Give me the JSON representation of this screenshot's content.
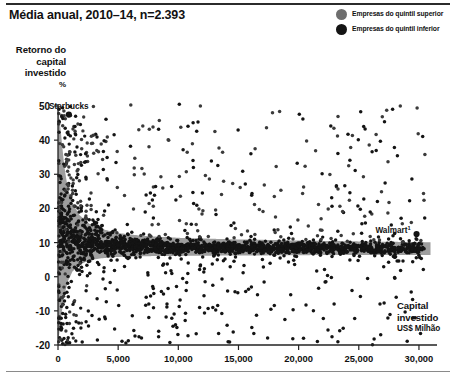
{
  "header": {
    "title": "Média anual, 2010–14, n=2.393"
  },
  "legend": {
    "position": "top-right",
    "items": [
      {
        "label": "Empresas do quintil superior",
        "color": "#6e6e6e",
        "key": "top-quintile"
      },
      {
        "label": "Empresas do quintil inferior",
        "color": "#141414",
        "key": "bottom-quintile"
      }
    ]
  },
  "axes": {
    "y": {
      "title_line1": "Retorno do",
      "title_line2": "capital",
      "title_line3": "investido",
      "unit": "%",
      "ticks": [
        50,
        40,
        30,
        20,
        10,
        0,
        -10,
        -20
      ],
      "tick_labels": [
        "50",
        "40",
        "30",
        "20",
        "10",
        "0",
        "-10",
        "-20"
      ],
      "min": -20,
      "max": 50
    },
    "x": {
      "title_line1": "Capital",
      "title_line2": "investido",
      "unit": "US$ Milhão",
      "ticks": [
        0,
        5000,
        10000,
        15000,
        20000,
        25000,
        30000
      ],
      "tick_labels": [
        "0",
        "5,000",
        "10,000",
        "15,000",
        "20,000",
        "25,000",
        "30,000"
      ],
      "min": 0,
      "max": 31500
    }
  },
  "annotations": [
    {
      "label": "Starbucks",
      "superscript": "",
      "x": 900,
      "y": 47.5
    },
    {
      "label": "Walmart",
      "superscript": "1",
      "x": 29800,
      "y": 12.5
    }
  ],
  "colors": {
    "band_fill": "#9e9e9e",
    "dot_dark": "#141414",
    "dot_mid": "#3a3a3a",
    "axis": "#222222",
    "rule": "#2b2b2b"
  },
  "chart_data": {
    "type": "scatter",
    "title": "Média anual, 2010–14, n=2.393",
    "xlabel": "Capital investido US$ Milhão",
    "ylabel": "Retorno do capital investido %",
    "xlim": [
      0,
      31500
    ],
    "ylim": [
      -20,
      50
    ],
    "grid": false,
    "legend_position": "top-right",
    "n_points_total": 2393,
    "series": [
      {
        "name": "Empresas do quintil superior",
        "color": "#6e6e6e",
        "description": "Shaded region: upper envelope of ROIC decaying hyperbolically with invested capital"
      },
      {
        "name": "Empresas do quintil inferior",
        "color": "#141414",
        "description": "Dense black cloud of individual firms concentrated near 5-10% ROIC"
      }
    ],
    "band": {
      "note": "Gray shaded area between upper and lower quintile envelopes",
      "upper_envelope": [
        [
          0,
          50
        ],
        [
          250,
          42
        ],
        [
          500,
          33
        ],
        [
          800,
          26
        ],
        [
          1200,
          21.5
        ],
        [
          1800,
          18
        ],
        [
          2600,
          15.5
        ],
        [
          3600,
          14
        ],
        [
          5000,
          12.8
        ],
        [
          7000,
          12
        ],
        [
          10000,
          11.4
        ],
        [
          14000,
          11
        ],
        [
          20000,
          10.6
        ],
        [
          26000,
          10.3
        ],
        [
          31000,
          10.1
        ]
      ],
      "lower_envelope": [
        [
          0,
          -20
        ],
        [
          250,
          -12
        ],
        [
          500,
          -6
        ],
        [
          800,
          -1.5
        ],
        [
          1200,
          1.5
        ],
        [
          1800,
          3.5
        ],
        [
          2600,
          4.8
        ],
        [
          3600,
          5.4
        ],
        [
          5000,
          5.8
        ],
        [
          7000,
          6.0
        ],
        [
          10000,
          6.1
        ],
        [
          14000,
          6.2
        ],
        [
          20000,
          6.3
        ],
        [
          26000,
          6.4
        ],
        [
          31000,
          6.4
        ]
      ]
    },
    "highlighted_points": [
      {
        "label": "Starbucks",
        "x": 900,
        "y": 47.5
      },
      {
        "label": "Walmart",
        "x": 29800,
        "y": 12.5
      }
    ]
  }
}
